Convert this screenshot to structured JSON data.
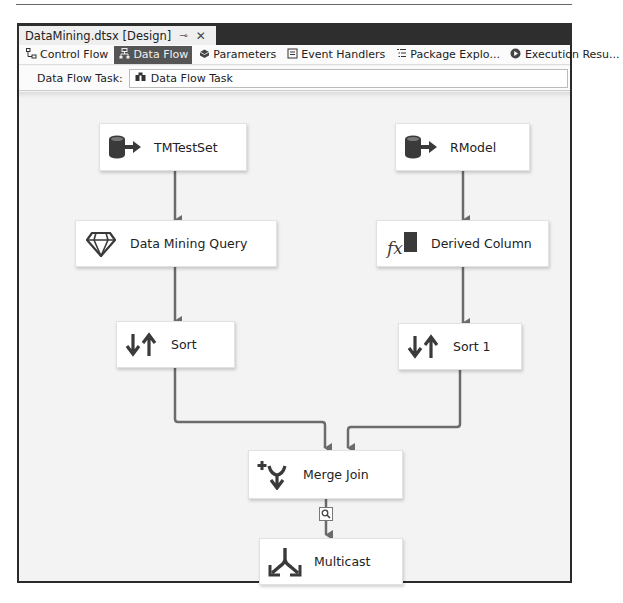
{
  "window": {
    "doc_tab_title": "DataMining.dtsx [Design]",
    "pin_glyph": "⊸",
    "close_glyph": "✕"
  },
  "toolbar": {
    "tabs": [
      {
        "label": "Control Flow",
        "icon": "control-flow-icon",
        "active": false
      },
      {
        "label": "Data Flow",
        "icon": "data-flow-icon",
        "active": true
      },
      {
        "label": "Parameters",
        "icon": "parameters-icon",
        "active": false
      },
      {
        "label": "Event Handlers",
        "icon": "event-handlers-icon",
        "active": false
      },
      {
        "label": "Package Explo...",
        "icon": "package-explorer-icon",
        "active": false
      },
      {
        "label": "Execution Resu...",
        "icon": "execution-results-icon",
        "active": false
      }
    ]
  },
  "task_bar": {
    "label": "Data Flow Task:",
    "selected_task": "Data Flow Task"
  },
  "components": [
    {
      "id": "tmtestset",
      "label": "TMTestSet",
      "icon": "source-icon"
    },
    {
      "id": "rmodel",
      "label": "RModel",
      "icon": "source-icon"
    },
    {
      "id": "dmq",
      "label": "Data Mining Query",
      "icon": "diamond-icon"
    },
    {
      "id": "derived",
      "label": "Derived Column",
      "icon": "fx-icon"
    },
    {
      "id": "sort",
      "label": "Sort",
      "icon": "sort-icon"
    },
    {
      "id": "sort1",
      "label": "Sort 1",
      "icon": "sort-icon"
    },
    {
      "id": "merge",
      "label": "Merge Join",
      "icon": "merge-join-icon"
    },
    {
      "id": "multicast",
      "label": "Multicast",
      "icon": "multicast-icon"
    }
  ],
  "colors": {
    "connector": "#6b6b6b",
    "active_tab_bg": "#555555",
    "titlebar": "#2e2e2e"
  }
}
